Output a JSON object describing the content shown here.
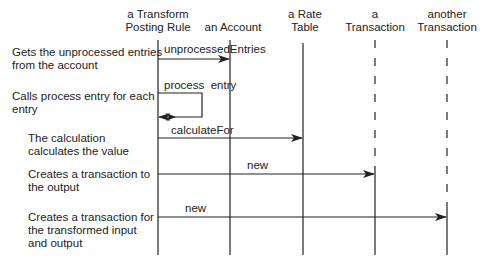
{
  "participants": [
    {
      "id": "rule",
      "label_line1": "a Transform",
      "label_line2": "Posting Rule",
      "x": 158
    },
    {
      "id": "account",
      "label_line1": "",
      "label_line2": "an  Account",
      "x": 230
    },
    {
      "id": "rate_table",
      "label_line1": "a Rate",
      "label_line2": "Table",
      "x": 303
    },
    {
      "id": "transaction",
      "label_line1": "a",
      "label_line2": "Transaction",
      "x": 375
    },
    {
      "id": "another_transaction",
      "label_line1": "another",
      "label_line2": "Transaction",
      "x": 447
    }
  ],
  "messages": [
    {
      "label": "unprocessedEntries",
      "from": "rule",
      "to": "account"
    },
    {
      "label": "process  entry",
      "from": "rule",
      "to": "rule",
      "self": true
    },
    {
      "label": "calculateFor",
      "from": "rule",
      "to": "rate_table"
    },
    {
      "label": "new",
      "from": "rule",
      "to": "transaction"
    },
    {
      "label": "new",
      "from": "rule",
      "to": "another_transaction"
    }
  ],
  "notes": [
    {
      "line1": "Gets the unprocessed entries",
      "line2": "from the account"
    },
    {
      "line1": "Calls process entry for each",
      "line2": "entry"
    },
    {
      "line1": "The calculation",
      "line2": "calculates the value"
    },
    {
      "line1": "Creates a transaction to",
      "line2": "the output"
    },
    {
      "line1": "Creates a transaction for",
      "line2": "the transformed input",
      "line3": "and output"
    }
  ]
}
